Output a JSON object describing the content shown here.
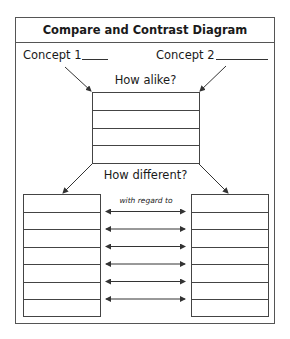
{
  "title": "Compare and Contrast Diagram",
  "concept1": {
    "label": "Concept 1",
    "value": ""
  },
  "concept2": {
    "label": "Concept 2",
    "value": ""
  },
  "alike": {
    "heading": "How alike?",
    "rows": [
      "",
      "",
      "",
      ""
    ]
  },
  "different": {
    "heading": "How different?",
    "regard_label": "with regard to",
    "left_rows": [
      "",
      "",
      "",
      "",
      "",
      "",
      ""
    ],
    "right_rows": [
      "",
      "",
      "",
      "",
      "",
      "",
      ""
    ],
    "arrow_count": 6
  },
  "colors": {
    "line": "#444444",
    "text": "#1a1a1a"
  }
}
